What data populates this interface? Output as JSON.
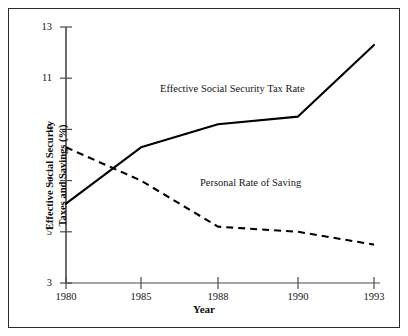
{
  "chart_data": {
    "type": "line",
    "title": "",
    "xlabel": "Year",
    "ylabel": "Effective Social Security Taxes and Savings (%)",
    "ylabel_line1": "Effective Social Security",
    "ylabel_line2": "Taxes and Savings (%)",
    "categories": [
      "1980",
      "1985",
      "1988",
      "1990",
      "1993"
    ],
    "x_positions": [
      66,
      141,
      218,
      298,
      374
    ],
    "yticks": [
      3,
      5,
      7,
      9,
      11,
      13
    ],
    "ytick_labels": [
      "3",
      "5",
      "7",
      "9",
      "11",
      "13"
    ],
    "ylim": [
      3,
      13
    ],
    "grid": false,
    "legend_position": "inline-annotations",
    "series": [
      {
        "name": "Effective Social Security Tax Rate",
        "style": "solid",
        "color": "#000000",
        "values": [
          6.1,
          8.3,
          9.2,
          9.5,
          12.3
        ]
      },
      {
        "name": "Personal Rate of Saving",
        "style": "dashed",
        "color": "#000000",
        "values": [
          8.3,
          7.0,
          5.2,
          5.0,
          4.5
        ]
      }
    ],
    "annotations": [
      {
        "text": "Effective Social Security Tax Rate",
        "x": 1986,
        "y": 10.2
      },
      {
        "text": "Personal Rate of Saving",
        "x": 1988.5,
        "y": 6.5
      }
    ]
  },
  "axis": {
    "x_tick_labels": [
      "1980",
      "1985",
      "1988",
      "1990",
      "1993"
    ],
    "y_tick_labels": [
      "3",
      "5",
      "7",
      "9",
      "11",
      "13"
    ]
  }
}
